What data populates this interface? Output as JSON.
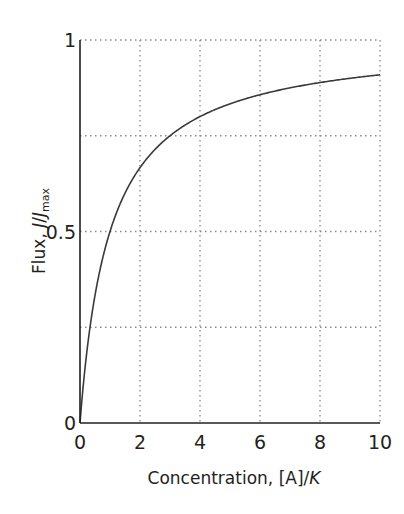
{
  "chart_data": {
    "type": "line",
    "title": "",
    "xlabel": "Concentration, [A]/K",
    "ylabel": "Flux, J/J_max",
    "xlabel_parts": {
      "prefix": "Concentration, [A]/",
      "italic": "K"
    },
    "ylabel_parts": {
      "prefix": "Flux, ",
      "italic1": "J",
      "slash": "/",
      "italic2": "J",
      "sub": "max"
    },
    "xlim": [
      0,
      10
    ],
    "ylim": [
      0,
      1
    ],
    "x_ticks": [
      0,
      2,
      4,
      6,
      8,
      10
    ],
    "x_tick_labels": [
      "0",
      "2",
      "4",
      "6",
      "8",
      "10"
    ],
    "y_ticks": [
      0,
      0.5,
      1
    ],
    "y_tick_labels": [
      "0",
      "0.5",
      "1"
    ],
    "grid": {
      "on": true,
      "style": "dotted",
      "x_lines": [
        2,
        4,
        6,
        8,
        10
      ],
      "y_lines": [
        0.25,
        0.5,
        0.75,
        1
      ]
    },
    "legend": null,
    "series": [
      {
        "name": "J/Jmax = x/(1+x)",
        "x": [
          0,
          0.25,
          0.5,
          1,
          1.5,
          2,
          3,
          4,
          5,
          6,
          7,
          8,
          9,
          10
        ],
        "y": [
          0,
          0.2,
          0.333,
          0.5,
          0.6,
          0.667,
          0.75,
          0.8,
          0.833,
          0.857,
          0.875,
          0.889,
          0.9,
          0.909
        ],
        "color": "#3a3a3a"
      }
    ]
  },
  "colors": {
    "axis": "#231f20",
    "grid": "#8a8a8a",
    "curve": "#3a3a3a"
  }
}
